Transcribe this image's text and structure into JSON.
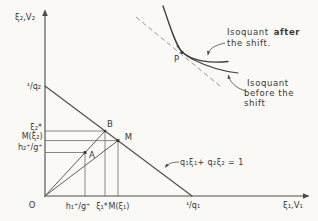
{
  "figure_colors": {
    "background": "#faf9f6",
    "line": "#4c4c4c",
    "curve": "#3f3f3f",
    "text": "#383838",
    "dashed_line": "#8a8a86"
  },
  "axis_labels": {
    "y": "ξ₂,V₂",
    "x": "ξ₁,V₁",
    "origin": "O",
    "y_intercept": "¹/q₂",
    "x_intercept": "¹/q₁"
  },
  "y_ticks": {
    "xi2_star": "ξ₂*",
    "m_xi2": "M(ξ₂)",
    "h2_over_g": "h₂⁺/g⁺"
  },
  "x_ticks": {
    "h1_over_g": "h₁⁺/g⁺",
    "xi1_star": "ξ₁*",
    "m_xi1": "M(ξ₁)"
  },
  "points": {
    "a": "A",
    "b": "B",
    "m": "M",
    "p": "P"
  },
  "annotations": {
    "budget_equation": "q₁ξ₁+ q₂ξ₂ = 1",
    "after_word1": "Isoquant",
    "after_word2": "after",
    "after_line2": "the shift.",
    "before_line1": "Isoquant",
    "before_line2": "before the",
    "before_line3": "shift"
  }
}
